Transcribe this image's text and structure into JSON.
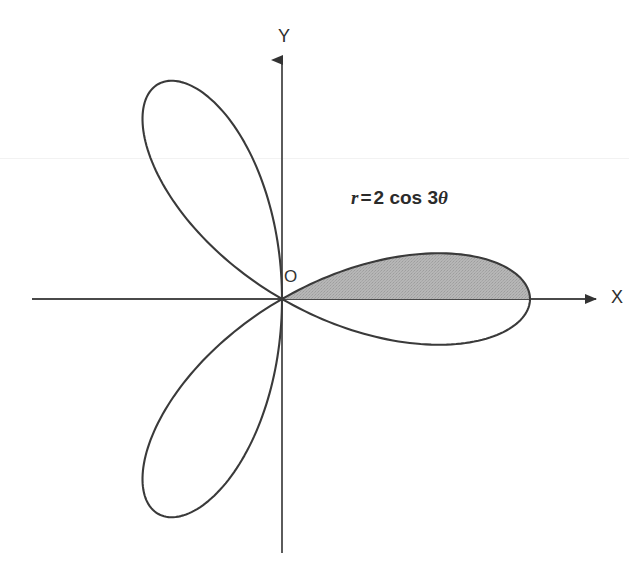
{
  "figure": {
    "background_color": "#ffffff",
    "curve_color": "#3a3a3a",
    "axis_color": "#4a4a4a",
    "shade_color": "#b0b0b0",
    "text_color": "#2e2e2e"
  },
  "axes": {
    "x_label": "X",
    "y_label": "Y",
    "origin_label": "O",
    "x_start_px": 32,
    "x_end_px": 608,
    "y_start_px": 553,
    "y_end_px": 48,
    "origin_x_px": 282,
    "origin_y_px": 299,
    "arrowheads": "solid-triangle"
  },
  "equation": {
    "variable": "r",
    "operator": "=",
    "amplitude": "2",
    "function": "cos",
    "multiple": "3",
    "angle": "θ",
    "full_text": "r = 2 cos 3θ"
  },
  "chart_data": {
    "type": "line",
    "coordinate_system": "polar",
    "equation": "r = 2*cos(3*theta)",
    "xlabel": "X",
    "ylabel": "Y",
    "grid": false,
    "legend": "none",
    "r_max": 2,
    "petal_count": 3,
    "petal_angles_deg": [
      0,
      120,
      240
    ],
    "petal_tip_radius": 2,
    "pixels_per_unit": 124,
    "theta_range_deg": [
      0,
      360
    ],
    "shaded_region": {
      "描述": "upper half of right-hand petal",
      "label": "shaded petal half",
      "theta_from_deg": 0,
      "theta_to_deg": 30,
      "fill_color": "#b0b0b0",
      "petal_index": 0
    },
    "annotations": [
      {
        "text": "r = 2 cos 3θ",
        "x_px": 351,
        "y_px": 199
      },
      {
        "text": "O",
        "x_px": 288,
        "y_px": 278
      },
      {
        "text": "X",
        "x_px": 615,
        "y_px": 298
      },
      {
        "text": "Y",
        "x_px": 285,
        "y_px": 36
      }
    ],
    "series": [
      {
        "name": "r = 2 cos 3θ",
        "values": [
          {
            "theta_deg": 0,
            "r": 2
          },
          {
            "theta_deg": 10,
            "r": 1.732
          },
          {
            "theta_deg": 20,
            "r": 1.0
          },
          {
            "theta_deg": 30,
            "r": 0
          },
          {
            "theta_deg": 40,
            "r": -1.0
          },
          {
            "theta_deg": 50,
            "r": -1.732
          },
          {
            "theta_deg": 60,
            "r": -2
          },
          {
            "theta_deg": 90,
            "r": 0
          },
          {
            "theta_deg": 120,
            "r": 2
          },
          {
            "theta_deg": 150,
            "r": 0
          },
          {
            "theta_deg": 180,
            "r": -2
          },
          {
            "theta_deg": 210,
            "r": 0
          },
          {
            "theta_deg": 240,
            "r": 2
          },
          {
            "theta_deg": 270,
            "r": 0
          },
          {
            "theta_deg": 300,
            "r": -2
          },
          {
            "theta_deg": 330,
            "r": 0
          },
          {
            "theta_deg": 360,
            "r": 2
          }
        ]
      }
    ]
  }
}
